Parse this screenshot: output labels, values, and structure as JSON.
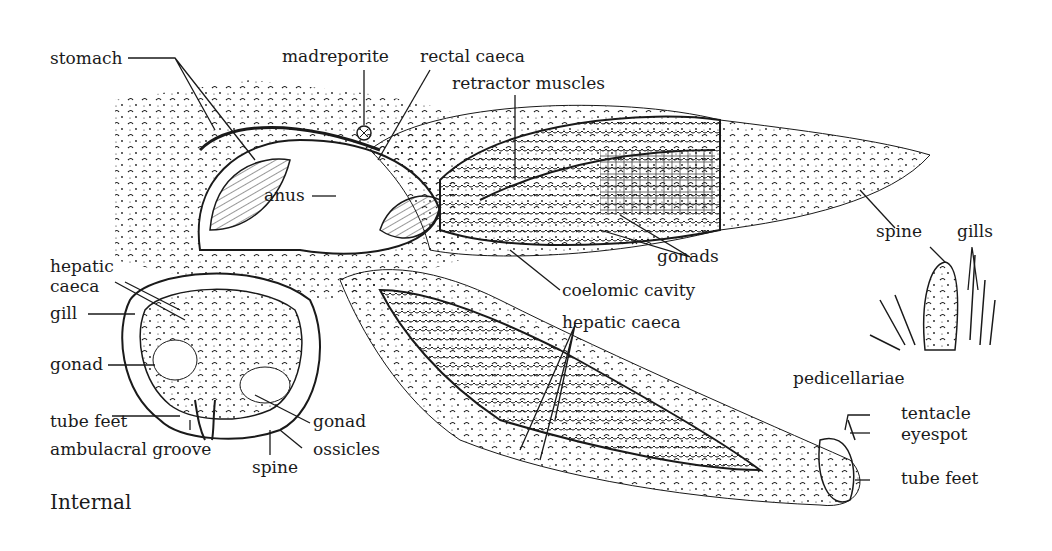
{
  "figure": {
    "caption": "Internal",
    "colors": {
      "ink": "#1a1a1a",
      "background": "#ffffff"
    }
  },
  "labels": {
    "stomach": "stomach",
    "madreporite": "madreporite",
    "rectal_caeca": "rectal caeca",
    "retractor_muscles": "retractor muscles",
    "anus": "anus",
    "hepatic_caeca_left": "hepatic\ncaeca",
    "hepatic_caeca_left_1": "hepatic",
    "hepatic_caeca_left_2": "caeca",
    "gill": "gill",
    "gonad_left": "gonad",
    "tube_feet_left": "tube feet",
    "ambulacral_groove": "ambulacral groove",
    "spine_bottom": "spine",
    "gonad_cross": "gonad",
    "ossicles": "ossicles",
    "gonads": "gonads",
    "coelomic_cavity": "coelomic cavity",
    "hepatic_caeca_right": "hepatic caeca",
    "spine_detail": "spine",
    "gills_detail": "gills",
    "pedicellariae": "pedicellariae",
    "tentacle": "tentacle",
    "eyespot": "eyespot",
    "tube_feet_right": "tube feet"
  }
}
